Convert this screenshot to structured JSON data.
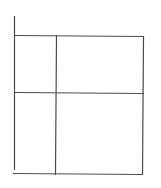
{
  "diagram": {
    "type": "grid-sketch",
    "stroke_color": "#4a4a4a",
    "stroke_width": 1.2,
    "lines": [
      {
        "id": "left-vertical",
        "x1": 14,
        "y1": 16,
        "x2": 14,
        "y2": 169
      },
      {
        "id": "top-horizontal",
        "x1": 14,
        "y1": 35,
        "x2": 143,
        "y2": 36
      },
      {
        "id": "middle-horizontal",
        "x1": 14,
        "y1": 92,
        "x2": 143,
        "y2": 93
      },
      {
        "id": "bottom-horizontal",
        "x1": 13,
        "y1": 173,
        "x2": 142,
        "y2": 174
      },
      {
        "id": "inner-vertical",
        "x1": 56,
        "y1": 35,
        "x2": 55,
        "y2": 174
      },
      {
        "id": "right-vertical",
        "x1": 143,
        "y1": 36,
        "x2": 142,
        "y2": 174
      }
    ],
    "cells": [
      {
        "id": "cell-top-left",
        "row": 0,
        "col": 0
      },
      {
        "id": "cell-top-right",
        "row": 0,
        "col": 1
      },
      {
        "id": "cell-bottom-left",
        "row": 1,
        "col": 0
      },
      {
        "id": "cell-bottom-right",
        "row": 1,
        "col": 1
      }
    ]
  }
}
